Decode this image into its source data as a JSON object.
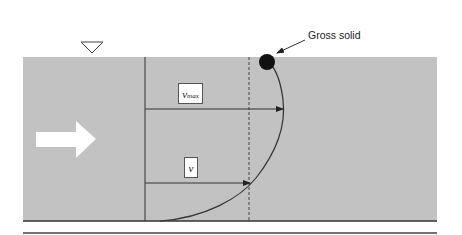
{
  "diagram": {
    "title": "",
    "labels": {
      "gross_solid": "Gross solid",
      "vmax_main": "v",
      "vmax_sub": "max",
      "v": "v"
    },
    "colors": {
      "water": "#c2c2c2",
      "lines": "#333333",
      "flow_arrow": "#ffffff",
      "solid": "#111111",
      "background": "#ffffff"
    },
    "elements": [
      "water-surface-symbol",
      "flow-direction-arrow",
      "velocity-profile-curve",
      "vmax-arrow",
      "v-arrow",
      "reference-vertical-line",
      "dashed-vertical-line",
      "gross-solid-particle",
      "channel-bed-lines"
    ]
  }
}
